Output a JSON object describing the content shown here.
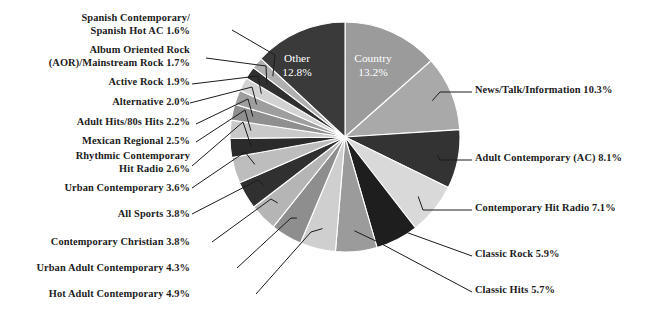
{
  "chart_data": {
    "type": "pie",
    "title": "",
    "subtitle": "",
    "xlabel": "",
    "ylabel": "",
    "legend_position": "callout-labels",
    "grid": false,
    "units": "percent",
    "start_angle_deg": 0,
    "direction": "clockwise",
    "categories": [
      "Country",
      "News/Talk/Information",
      "Adult Contemporary (AC)",
      "Contemporary Hit Radio",
      "Classic Rock",
      "Classic Hits",
      "Hot Adult Contemporary",
      "Urban Adult Contemporary",
      "Contemporary Christian",
      "All Sports",
      "Urban Contemporary",
      "Rhythmic Contemporary Hit Radio",
      "Mexican Regional",
      "Adult Hits/80s Hits",
      "Alternative",
      "Active Rock",
      "Album Oriented Rock (AOR)/Mainstream Rock",
      "Spanish Contemporary/Spanish Hot AC",
      "Other"
    ],
    "values": [
      13.2,
      10.3,
      8.1,
      7.1,
      5.9,
      5.7,
      4.9,
      4.3,
      3.8,
      3.8,
      3.6,
      2.6,
      2.5,
      2.2,
      2.0,
      1.9,
      1.7,
      1.6,
      12.8
    ],
    "colors": [
      "#9b9b9b",
      "#a9a9a9",
      "#333333",
      "#d9d9d9",
      "#1e1e1e",
      "#9b9b9b",
      "#cfcfcf",
      "#8e8e8e",
      "#b5b5b5",
      "#303030",
      "#bdbdbd",
      "#2b2b2b",
      "#c9c9c9",
      "#8f8f8f",
      "#9e9e9e",
      "#d2d2d2",
      "#2f2f2f",
      "#b0b0b0",
      "#3a3a3a"
    ]
  },
  "inner_labels": [
    {
      "name": "Other",
      "label": "Other",
      "value": "12.8%"
    },
    {
      "name": "Country",
      "label": "Country",
      "value": "13.2%"
    }
  ],
  "callouts_left": [
    {
      "text": "Spanish Contemporary/\nSpanish Hot AC 1.6%"
    },
    {
      "text": "Album Oriented Rock\n(AOR)/Mainstream Rock 1.7%"
    },
    {
      "text": "Active Rock 1.9%"
    },
    {
      "text": "Alternative 2.0%"
    },
    {
      "text": "Adult Hits/80s Hits 2.2%"
    },
    {
      "text": "Mexican Regional 2.5%"
    },
    {
      "text": "Rhythmic Contemporary\nHit Radio 2.6%"
    },
    {
      "text": "Urban Contemporary 3.6%"
    },
    {
      "text": "All Sports 3.8%"
    },
    {
      "text": "Contemporary Christian 3.8%"
    },
    {
      "text": "Urban Adult Contemporary 4.3%"
    },
    {
      "text": "Hot Adult Contemporary 4.9%"
    }
  ],
  "callouts_right": [
    {
      "text": "News/Talk/Information 10.3%"
    },
    {
      "text": "Adult Contemporary (AC) 8.1%"
    },
    {
      "text": "Contemporary Hit Radio 7.1%"
    },
    {
      "text": "Classic Rock 5.9%"
    },
    {
      "text": "Classic Hits 5.7%"
    }
  ]
}
